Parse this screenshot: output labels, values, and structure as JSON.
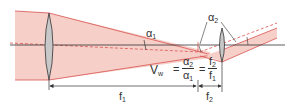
{
  "diagram": {
    "type": "telescope optics diagram",
    "colors": {
      "beam_fill": "#f6cfc9",
      "beam_edge": "#d9534f",
      "dashed_ray": "#d9534f",
      "axis": "#333333",
      "lens_fill": "#c8c8c8",
      "lens_edge": "#333333"
    },
    "labels": {
      "alpha1": "α",
      "alpha1_sub": "1",
      "alpha2": "α",
      "alpha2_sub": "2",
      "formula_lhs": "V",
      "formula_lhs_sub": "w",
      "equals": "=",
      "frac1_num": "α",
      "frac1_num_sub": "2",
      "frac1_den": "α",
      "frac1_den_sub": "1",
      "frac2_num": "f",
      "frac2_num_sub": "2",
      "frac2_den": "f",
      "frac2_den_sub": "1",
      "f1": "f",
      "f1_sub": "1",
      "f2": "f",
      "f2_sub": "2"
    },
    "elements": [
      "objective lens",
      "eyepiece lens",
      "optical axis",
      "incoming light beam",
      "outgoing light beam",
      "focal length f1 dimension",
      "focal length f2 dimension"
    ]
  }
}
